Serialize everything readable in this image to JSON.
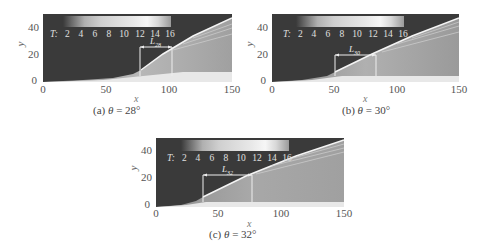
{
  "figure": {
    "colorbar": {
      "variable": "T:",
      "ticks": [
        "2",
        "4",
        "6",
        "8",
        "10",
        "12",
        "14",
        "16"
      ]
    },
    "axes": {
      "xlabel": "x",
      "ylabel": "y",
      "xticks": [
        "0",
        "50",
        "100",
        "150"
      ],
      "yticks": [
        "40",
        "20",
        "0"
      ],
      "xlim": [
        0,
        150
      ],
      "ylim": [
        0,
        50
      ]
    },
    "panels": [
      {
        "id": "a",
        "caption_prefix": "(a) ",
        "theta_symbol": "θ",
        "caption_eq": " = 28°",
        "length_label": "L",
        "length_sub": "28",
        "region_start_x": 77,
        "region_end_x": 103
      },
      {
        "id": "b",
        "caption_prefix": "(b) ",
        "theta_symbol": "θ",
        "caption_eq": " = 30°",
        "length_label": "L",
        "length_sub": "30",
        "region_start_x": 51,
        "region_end_x": 84
      },
      {
        "id": "c",
        "caption_prefix": "(c) ",
        "theta_symbol": "θ",
        "caption_eq": " = 32°",
        "length_label": "L",
        "length_sub": "32",
        "region_start_x": 37,
        "region_end_x": 77
      }
    ]
  }
}
